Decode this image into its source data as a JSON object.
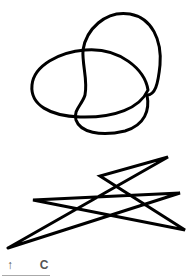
{
  "canvas": {
    "stroke_color": "#000000",
    "background": "#ffffff",
    "drawings": [
      {
        "name": "looped-curve",
        "kind": "freehand-curve"
      },
      {
        "name": "zigzag-star",
        "kind": "freehand-polyline"
      }
    ]
  },
  "toolbar": {
    "undo_icon": "↑",
    "clear_label": "C",
    "text_color": "#555555"
  }
}
